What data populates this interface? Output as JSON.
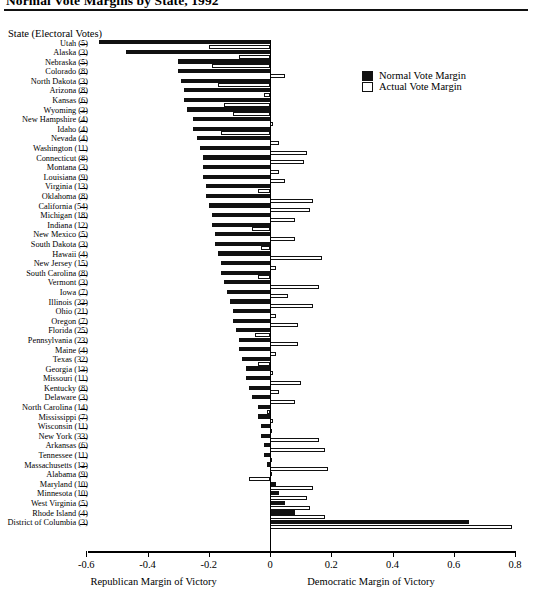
{
  "title": "Normal Vote Margins by State, 1992",
  "axis_header": "State (Electoral Votes)",
  "legend": [
    {
      "key": "normal",
      "label": "Normal Vote Margin",
      "swatch": "filled"
    },
    {
      "key": "actual",
      "label": "Actual Vote Margin",
      "swatch": "open"
    }
  ],
  "axis_names": {
    "left": "Republican Margin of Victory",
    "right": "Democratic Margin of Victory"
  },
  "chart_data": {
    "type": "bar",
    "orientation": "horizontal",
    "title": "Normal Vote Margins by State, 1992",
    "xlabel": "Margin of Victory",
    "ylabel": "State (Electoral Votes)",
    "xlim": [
      -0.6,
      0.8
    ],
    "xticks": [
      -0.6,
      -0.4,
      -0.2,
      0,
      0.2,
      0.4,
      0.6,
      0.8
    ],
    "xticklabels": [
      "-0.6",
      "-0.4",
      "-0.2",
      "0",
      "0.2",
      "0.4",
      "0.6",
      "0.8"
    ],
    "grid": false,
    "legend_position": "upper-right",
    "series": [
      {
        "name": "Normal Vote Margin",
        "color": "#111111"
      },
      {
        "name": "Actual Vote Margin",
        "color": "#ffffff"
      }
    ],
    "categories": [
      "Utah (5)",
      "Alaska (3)",
      "Nebraska (5)",
      "Colorado (8)",
      "North Dakota (3)",
      "Arizona (8)",
      "Kansas (6)",
      "Wyoming (3)",
      "New Hampshire (4)",
      "Idaho (4)",
      "Nevada (4)",
      "Washington (11)",
      "Connecticut (8)",
      "Montana (3)",
      "Louisiana (9)",
      "Virginia (13)",
      "Oklahoma (8)",
      "California (54)",
      "Michigan (18)",
      "Indiana (12)",
      "New Mexico (5)",
      "South Dakota (3)",
      "Hawaii (4)",
      "New Jersey (15)",
      "South Carolina (8)",
      "Vermont (3)",
      "Iowa (7)",
      "Illinois (22)",
      "Ohio (21)",
      "Oregon (7)",
      "Florida (25)",
      "Pennsylvania (23)",
      "Maine (4)",
      "Texas (32)",
      "Georgia (13)",
      "Missouri (11)",
      "Kentucky (8)",
      "Delaware (3)",
      "North Carolina (14)",
      "Mississippi (7)",
      "Wisconsin (11)",
      "New York (33)",
      "Arkansas (6)",
      "Tennessee (11)",
      "Massachusetts (12)",
      "Alabama (9)",
      "Maryland (10)",
      "Minnesota (10)",
      "West Virginia (5)",
      "Rhode Island (4)",
      "District of Columbia (3)"
    ],
    "normal_values": [
      -0.56,
      -0.47,
      -0.3,
      -0.3,
      -0.29,
      -0.28,
      -0.28,
      -0.27,
      -0.25,
      -0.25,
      -0.24,
      -0.23,
      -0.22,
      -0.22,
      -0.22,
      -0.21,
      -0.21,
      -0.2,
      -0.19,
      -0.19,
      -0.18,
      -0.18,
      -0.17,
      -0.16,
      -0.16,
      -0.15,
      -0.14,
      -0.13,
      -0.12,
      -0.12,
      -0.11,
      -0.1,
      -0.1,
      -0.09,
      -0.08,
      -0.08,
      -0.07,
      -0.06,
      -0.04,
      -0.04,
      -0.03,
      -0.03,
      -0.02,
      -0.02,
      -0.01,
      0.005,
      0.02,
      0.03,
      0.05,
      0.08,
      0.65
    ],
    "actual_values": [
      -0.2,
      -0.1,
      -0.19,
      0.05,
      -0.17,
      -0.02,
      -0.15,
      -0.12,
      0.01,
      -0.16,
      0.03,
      0.12,
      0.11,
      0.03,
      0.05,
      -0.04,
      0.14,
      0.13,
      0.08,
      -0.06,
      0.08,
      -0.03,
      0.17,
      0.02,
      -0.04,
      0.16,
      0.06,
      0.14,
      0.02,
      0.09,
      -0.05,
      0.09,
      0.02,
      -0.04,
      0.01,
      0.1,
      0.03,
      0.08,
      -0.01,
      0.01,
      0.005,
      0.16,
      0.18,
      0.005,
      0.19,
      -0.07,
      0.14,
      0.12,
      0.13,
      0.18,
      0.79
    ]
  }
}
